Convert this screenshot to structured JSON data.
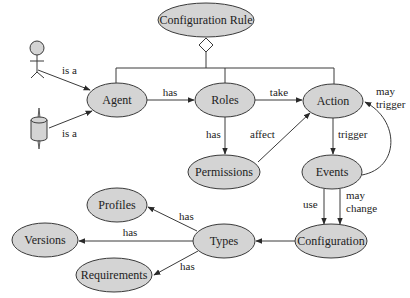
{
  "diagram": {
    "nodes": {
      "configuration_rule": "Configuration Rule",
      "agent": "Agent",
      "roles": "Roles",
      "action": "Action",
      "permissions": "Permissions",
      "events": "Events",
      "configuration": "Configuration",
      "types": "Types",
      "profiles": "Profiles",
      "versions": "Versions",
      "requirements": "Requirements"
    },
    "actors": {
      "human": "human-actor-icon",
      "machine": "machine-actor-icon"
    },
    "edges": {
      "human_is_a": "is a",
      "machine_is_a": "is a",
      "agent_has_roles": "has",
      "roles_take_action": "take",
      "roles_has_permissions": "has",
      "permissions_affect_action": "affect",
      "action_trigger_events": "trigger",
      "events_may_trigger_line1": "may",
      "events_may_trigger_line2": "trigger",
      "events_use_configuration": "use",
      "events_may_change_line1": "may",
      "events_may_change_line2": "change",
      "configuration_to_types": "",
      "types_has_profiles": "has",
      "types_has_versions": "has",
      "types_has_requirements": "has"
    },
    "colors": {
      "node_fill": "#d4d4d4",
      "stroke": "#3a3a3a",
      "background": "#ffffff"
    }
  }
}
